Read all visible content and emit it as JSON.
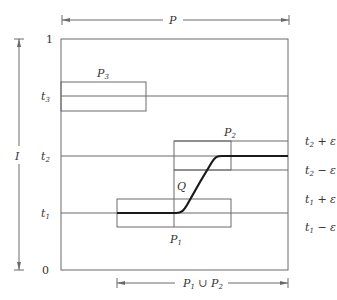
{
  "diagram": {
    "colors": {
      "line": "#6a6a6a",
      "curve": "#1a1a1a",
      "text": "#333333"
    },
    "top_arrow": {
      "label": "P"
    },
    "bottom_arrow": {
      "label_main": "P",
      "label_sub1": "1",
      "label_union": " ∪ ",
      "label_main2": "P",
      "label_sub2": "2"
    },
    "vertical_arrow": {
      "label": "I"
    },
    "y_axis": {
      "top": "1",
      "bottom": "0",
      "t3": {
        "main": "t",
        "sub": "3"
      },
      "t2": {
        "main": "t",
        "sub": "2"
      },
      "t1": {
        "main": "t",
        "sub": "1"
      }
    },
    "right_labels": {
      "t2_plus": {
        "main": "t",
        "sub": "2",
        "rest": " + ε"
      },
      "t2_minus": {
        "main": "t",
        "sub": "2",
        "rest": " − ε"
      },
      "t1_plus": {
        "main": "t",
        "sub": "1",
        "rest": " + ε"
      },
      "t1_minus": {
        "main": "t",
        "sub": "1",
        "rest": " − ε"
      }
    },
    "boxes": {
      "P3": {
        "main": "P",
        "sub": "3"
      },
      "P2": {
        "main": "P",
        "sub": "2"
      },
      "P1": {
        "main": "P",
        "sub": "1"
      }
    },
    "path_label": "Q"
  }
}
